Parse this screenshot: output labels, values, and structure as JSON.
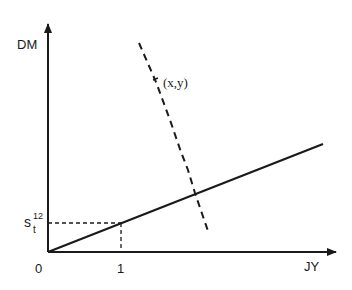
{
  "diagram": {
    "axes": {
      "y_label": "DM",
      "x_label": "JY",
      "origin_label": "0",
      "x_tick_label": "1",
      "y_tick_label": {
        "base": "s",
        "subscript": "t",
        "superscript": "12"
      }
    },
    "curves": [
      {
        "name": "solid-line-through-origin",
        "style": "solid"
      },
      {
        "name": "dashed-curve",
        "style": "dashed",
        "label": "(x,y)"
      }
    ],
    "colors": {
      "ink": "#1a1a1a",
      "background": "#ffffff"
    }
  }
}
